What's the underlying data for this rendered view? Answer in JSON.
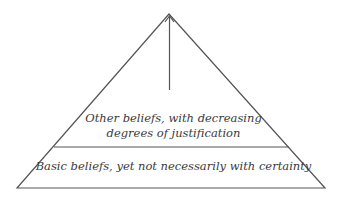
{
  "diagram": {
    "type": "foundationalism-pyramid",
    "tiers": [
      {
        "position": "upper",
        "lines": [
          "Other beliefs, with decreasing",
          "degrees of justification"
        ]
      },
      {
        "position": "base",
        "lines": [
          "Basic beliefs, yet not necessarily with certainty"
        ]
      }
    ],
    "arrow": {
      "direction": "up",
      "meaning": "increasing distance from basic beliefs"
    },
    "colors": {
      "stroke": "#555555",
      "text": "#3a3a3a",
      "background": "#ffffff"
    }
  }
}
